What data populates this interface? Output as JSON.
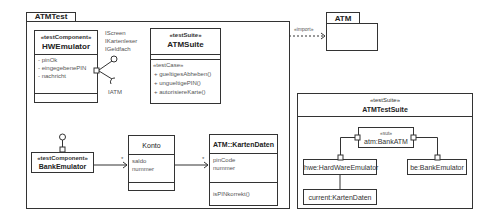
{
  "packages": {
    "atm_test": {
      "name": "ATMTest"
    },
    "atm": {
      "name": "ATM"
    }
  },
  "import_dependency": {
    "label": "«import»"
  },
  "hw_emulator": {
    "stereotype": "«testComponent»",
    "name": "HWEmulator",
    "attributes": [
      "- pinOk",
      "- eingegebenePIN",
      "- nachricht"
    ],
    "provided_interfaces": [
      "IScreen",
      "IKartenleser",
      "IGeldfach"
    ],
    "required_interface": "IATM"
  },
  "atm_suite": {
    "stereotype": "«testSuite»",
    "name": "ATMSuite",
    "operations_stereotype": "«testCase»",
    "operations": [
      "+ gueltigesAbheben()",
      "+ ungueltigePIN()",
      "+ autorisiereKarte()"
    ]
  },
  "bank_emulator": {
    "stereotype": "«testComponent»",
    "name": "BankEmulator"
  },
  "konto": {
    "name": "Konto",
    "attributes": [
      "saldo",
      "nummer"
    ]
  },
  "karten_daten": {
    "name": "ATM::KartenDaten",
    "attributes": [
      "pinCode",
      "nummer"
    ],
    "operations": [
      "isPINkorrekt()"
    ]
  },
  "associations": [
    {
      "from": "BankEmulator",
      "to": "Konto",
      "multiplicity": "*"
    },
    {
      "from": "Konto",
      "to": "ATM::KartenDaten",
      "multiplicity": "*"
    }
  ],
  "atm_test_suite": {
    "stereotype": "«testSuite»",
    "name": "ATMTestSuite",
    "parts": {
      "sut": {
        "stereotype": "«sut»",
        "name": "atm:BankATM"
      },
      "hwe": {
        "name": "hwe:HardWareEmulator"
      },
      "be": {
        "name": "be:BankEmulator"
      },
      "current": {
        "name": "current:KartenDaten"
      }
    }
  }
}
